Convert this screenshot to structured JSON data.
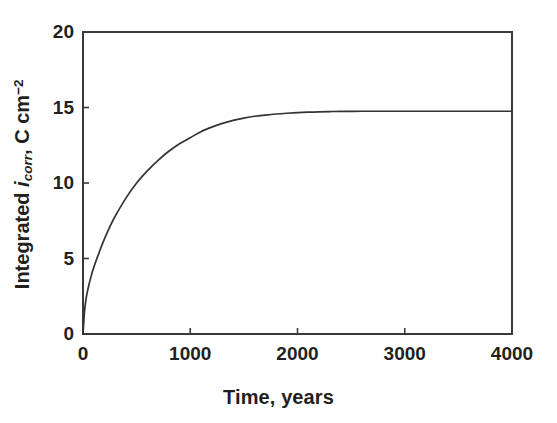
{
  "figure": {
    "background": "#ffffff",
    "line_color": "#333333",
    "axis_color": "#3a3a3a",
    "text_color": "#231f20"
  },
  "chart_data": {
    "type": "line",
    "title": "",
    "xlabel": "Time, years",
    "ylabel_plain": "Integrated icorr, C cm-2",
    "ylabel_parts": {
      "prefix": "Integrated ",
      "symbol": "i",
      "symbol_sub": "corr",
      "suffix": ", C cm",
      "unit_sup": "−2"
    },
    "xlim": [
      0,
      4000
    ],
    "ylim": [
      0,
      20
    ],
    "xticks": [
      0,
      1000,
      2000,
      3000,
      4000
    ],
    "xtick_labels": [
      "0",
      "1000",
      "2000",
      "3000",
      "4000"
    ],
    "yticks": [
      0,
      5,
      10,
      15,
      20
    ],
    "ytick_labels": [
      "0",
      "5",
      "10",
      "15",
      "20"
    ],
    "grid": false,
    "legend": null,
    "tick_direction": "in",
    "frame": "box",
    "series": [
      {
        "name": "Integrated corrosion current",
        "plateau_value": 14.75,
        "x": [
          0,
          10,
          20,
          35,
          50,
          75,
          100,
          150,
          200,
          250,
          300,
          400,
          500,
          600,
          700,
          800,
          900,
          1000,
          1100,
          1200,
          1300,
          1400,
          1500,
          1600,
          1700,
          1800,
          1900,
          2000,
          2100,
          2200,
          2300,
          2400,
          2600,
          2800,
          3000,
          3200,
          3400,
          3600,
          3800,
          4000
        ],
        "y": [
          0.0,
          1.1,
          1.9,
          2.6,
          3.1,
          3.8,
          4.4,
          5.4,
          6.3,
          7.1,
          7.8,
          9.0,
          10.0,
          10.8,
          11.5,
          12.1,
          12.6,
          13.0,
          13.4,
          13.7,
          13.95,
          14.15,
          14.3,
          14.42,
          14.5,
          14.57,
          14.62,
          14.66,
          14.69,
          14.71,
          14.73,
          14.74,
          14.75,
          14.75,
          14.75,
          14.75,
          14.75,
          14.75,
          14.75,
          14.75
        ]
      }
    ]
  },
  "geometry": {
    "plot_left_px": 83,
    "plot_right_px": 512,
    "plot_top_px": 32,
    "plot_bottom_px": 334
  }
}
